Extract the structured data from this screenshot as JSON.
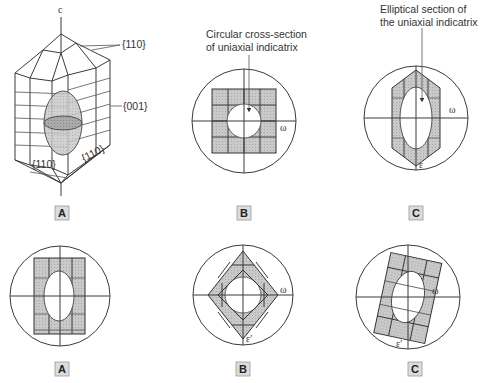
{
  "figure": {
    "top_row": {
      "crystal": {
        "axis_label": "c",
        "face_labels": [
          "{110}",
          "{001}",
          "{110}",
          "{110}"
        ],
        "panel_label": "A"
      },
      "panel_b": {
        "caption_line1": "Circular cross-section",
        "caption_line2": "of uniaxial indicatrix",
        "omega": "ω",
        "panel_label": "B"
      },
      "panel_c": {
        "caption_line1": "Elliptical section of",
        "caption_line2": "the uniaxial indicatrix",
        "omega": "ω",
        "epsilon": "ε",
        "panel_label": "C"
      }
    },
    "bottom_row": {
      "panel_a": {
        "panel_label": "A"
      },
      "panel_b": {
        "omega": "ω",
        "epsilon_prime": "ε′",
        "panel_label": "B"
      },
      "panel_c": {
        "omega": "ω",
        "epsilon_prime": "ε′",
        "panel_label": "C"
      }
    },
    "colors": {
      "line": "#3a3a3a",
      "fill": "#c8c8c8",
      "dark_fill": "#a8a8a8",
      "label_box": "#dcdcdc"
    }
  }
}
